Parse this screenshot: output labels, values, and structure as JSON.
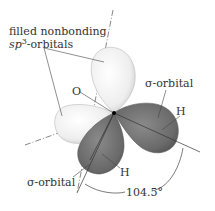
{
  "diagram": {
    "labels": {
      "nonbonding_line1": "filled nonbonding",
      "nonbonding_sp": "sp",
      "nonbonding_sup": "3",
      "nonbonding_rest": "-orbitals",
      "oxygen": "O",
      "sigma_right": "σ-orbital",
      "hydrogen_right": "H",
      "hydrogen_bottom": "H",
      "sigma_left": "σ-orbital",
      "angle": "104.5°"
    },
    "colors": {
      "nonbonding_lobe": "#f2f2f2",
      "sigma_lobe": "#6e6e6e",
      "lines": "#444444"
    }
  }
}
